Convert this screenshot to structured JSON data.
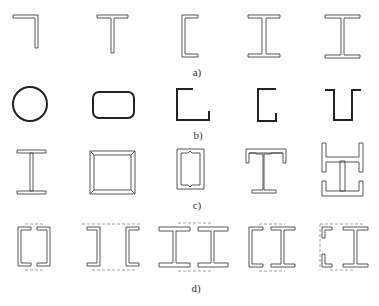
{
  "figure": {
    "rows": [
      {
        "id": "a",
        "label": "a)",
        "description": "Rolled sections: angle, T-section, channel, I-beam, wide-flange I-beam",
        "shapes": [
          "angle",
          "t-section",
          "channel",
          "i-beam",
          "wide-flange-i-beam"
        ]
      },
      {
        "id": "b",
        "label": "b)",
        "description": "Cold-formed / thin-walled sections: circular tube, rounded rectangular tube, angle, channel, hat section",
        "shapes": [
          "circular-tube",
          "rounded-rect-tube",
          "thin-angle",
          "thin-channel",
          "hat-section"
        ]
      },
      {
        "id": "c",
        "label": "c)",
        "description": "Built-up welded sections: welded I, welded box, lipped channel box, T with channels, cross-shaped built-up",
        "shapes": [
          "welded-i",
          "welded-box",
          "double-lipped-channel-box",
          "t-with-channel-caps",
          "cruciform-built-up"
        ]
      },
      {
        "id": "d",
        "label": "d)",
        "description": "Laced/battened compound sections with dashed lacing lines",
        "shapes": [
          "two-channels-toes-in",
          "two-channels-toes-out",
          "two-i-beams",
          "channel-and-i-beam",
          "angles-and-i-beam"
        ]
      }
    ]
  }
}
